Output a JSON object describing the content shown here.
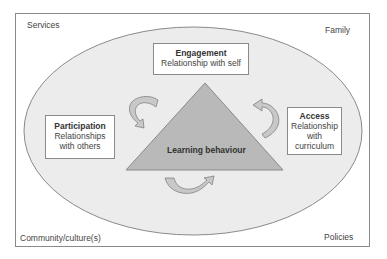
{
  "diagram": {
    "corners": {
      "top_left": "Services",
      "top_right": "Family",
      "bottom_left": "Community/culture(s)",
      "bottom_right": "Policies"
    },
    "center": {
      "label": "Learning behaviour",
      "shape": "triangle",
      "fill": "#b9b9b9"
    },
    "nodes": [
      {
        "title": "Engagement",
        "subtitle": "Relationship with self"
      },
      {
        "title": "Participation",
        "subtitle_lines": [
          "Relationships",
          "with others"
        ]
      },
      {
        "title": "Access",
        "subtitle_lines": [
          "Relationship",
          "with",
          "curriculum"
        ]
      }
    ],
    "arrows": [
      "curved-arrow-top-left",
      "curved-arrow-top-right",
      "curved-arrow-bottom"
    ],
    "colors": {
      "ellipse_fill": "#ececec",
      "frame_stroke": "#8a8a8a",
      "arrow_fill": "#c8c8c8"
    }
  }
}
